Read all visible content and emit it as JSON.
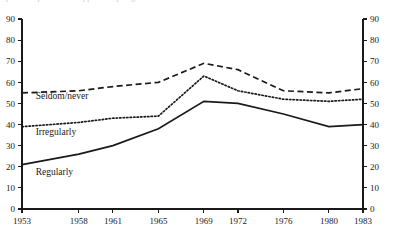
{
  "caption": {
    "text": "partial caption text cropped at top edge"
  },
  "chart_data": {
    "type": "line",
    "title": "",
    "xlabel": "",
    "ylabel": "",
    "categories": [
      "1953",
      "1958",
      "1961",
      "1965",
      "1969",
      "1972",
      "1976",
      "1980",
      "1983"
    ],
    "x_positions": [
      1953,
      1958,
      1961,
      1965,
      1969,
      1972,
      1976,
      1980,
      1983
    ],
    "xlim": [
      1953,
      1983
    ],
    "ylim": [
      0,
      90
    ],
    "y_ticks": [
      0,
      10,
      20,
      30,
      40,
      50,
      60,
      70,
      80,
      90
    ],
    "y_ticks_right": [
      0,
      10,
      20,
      30,
      40,
      50,
      60,
      70,
      80,
      90
    ],
    "grid": false,
    "legend_position": "inline-labels",
    "axis_color": "#1a1a1a",
    "series": [
      {
        "name": "Seldom/never",
        "style": "dashed",
        "label_x": 1954.2,
        "label_y": 52,
        "values": [
          55,
          56,
          58,
          60,
          69,
          66,
          56,
          55,
          57
        ]
      },
      {
        "name": "Irregularly",
        "style": "dotted",
        "label_x": 1954.2,
        "label_y": 35,
        "values": [
          39,
          41,
          43,
          44,
          63,
          56,
          52,
          51,
          52
        ]
      },
      {
        "name": "Regularly",
        "style": "solid",
        "label_x": 1954.2,
        "label_y": 16,
        "values": [
          21,
          26,
          30,
          38,
          51,
          50,
          45,
          39,
          40
        ]
      }
    ]
  }
}
